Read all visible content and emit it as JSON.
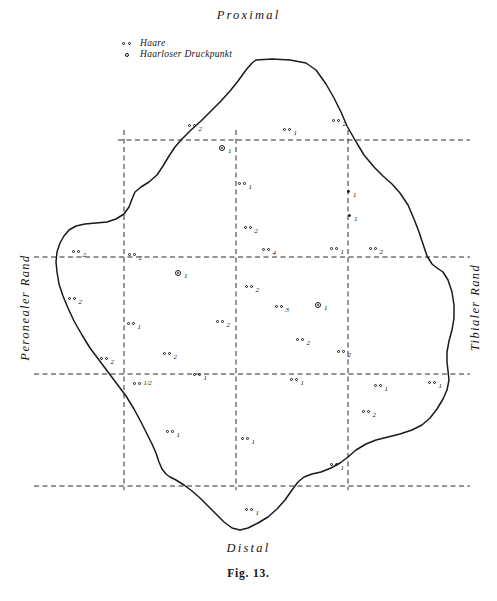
{
  "figure": {
    "caption": "Fig. 13.",
    "orientation_labels": {
      "top": "Proximal",
      "bottom": "Distal",
      "left": "Peronealer Rand",
      "right": "Tibialer Rand"
    },
    "legend": {
      "items": [
        {
          "symbol": "double-dot",
          "label": "Haare"
        },
        {
          "symbol": "circle",
          "label": "Haarloser Druckpunkt"
        }
      ]
    },
    "colors": {
      "ink": "#141414",
      "outline": "#1a1a1a",
      "grid": "#2a2a2a",
      "background": "#ffffff"
    }
  },
  "chart_data": {
    "type": "scatter",
    "title": "Fig. 13.",
    "xlabel": "",
    "ylabel": "",
    "xlim": [
      0,
      497
    ],
    "ylim": [
      0,
      601
    ],
    "grid": true,
    "grid_style": "dashed",
    "grid_x": [
      124,
      236,
      348
    ],
    "grid_y": [
      140,
      257,
      374,
      486
    ],
    "legend_position": "top-left",
    "series": [
      {
        "name": "Haare",
        "marker": "double-circle-pair",
        "points": [
          {
            "x": 188,
            "y": 124,
            "label": "2"
          },
          {
            "x": 283,
            "y": 128,
            "label": "1"
          },
          {
            "x": 332,
            "y": 119,
            "label": "2"
          },
          {
            "x": 238,
            "y": 182,
            "label": "1"
          },
          {
            "x": 244,
            "y": 226,
            "label": "2"
          },
          {
            "x": 262,
            "y": 248,
            "label": "4"
          },
          {
            "x": 330,
            "y": 247,
            "label": "1"
          },
          {
            "x": 369,
            "y": 247,
            "label": "2"
          },
          {
            "x": 72,
            "y": 250,
            "label": "2"
          },
          {
            "x": 128,
            "y": 253,
            "label": "2"
          },
          {
            "x": 245,
            "y": 285,
            "label": "2"
          },
          {
            "x": 275,
            "y": 305,
            "label": "3"
          },
          {
            "x": 68,
            "y": 297,
            "label": "2"
          },
          {
            "x": 127,
            "y": 322,
            "label": "1"
          },
          {
            "x": 216,
            "y": 320,
            "label": "2"
          },
          {
            "x": 296,
            "y": 338,
            "label": "2"
          },
          {
            "x": 337,
            "y": 350,
            "label": "2"
          },
          {
            "x": 100,
            "y": 357,
            "label": "2"
          },
          {
            "x": 163,
            "y": 352,
            "label": "2"
          },
          {
            "x": 193,
            "y": 373,
            "label": "1"
          },
          {
            "x": 133,
            "y": 382,
            "label": "1/2"
          },
          {
            "x": 290,
            "y": 378,
            "label": "1"
          },
          {
            "x": 374,
            "y": 384,
            "label": "1"
          },
          {
            "x": 428,
            "y": 381,
            "label": "1"
          },
          {
            "x": 166,
            "y": 430,
            "label": "1"
          },
          {
            "x": 241,
            "y": 437,
            "label": "1"
          },
          {
            "x": 362,
            "y": 410,
            "label": "2"
          },
          {
            "x": 245,
            "y": 508,
            "label": "1"
          },
          {
            "x": 330,
            "y": 463,
            "label": "1"
          }
        ]
      },
      {
        "name": "Haarloser Druckpunkt",
        "marker": "double-ring",
        "points": [
          {
            "x": 219,
            "y": 146,
            "label": "1"
          },
          {
            "x": 175,
            "y": 271,
            "label": "1"
          },
          {
            "x": 315,
            "y": 303,
            "label": "1"
          }
        ]
      },
      {
        "name": "filled point",
        "marker": "filled-dot",
        "points": [
          {
            "x": 347,
            "y": 190,
            "label": "1"
          },
          {
            "x": 348,
            "y": 214,
            "label": "1"
          }
        ]
      }
    ],
    "outline": {
      "name": "foot-sole-outline",
      "closed": true,
      "points": [
        [
          256,
          60
        ],
        [
          272,
          59
        ],
        [
          290,
          60
        ],
        [
          306,
          63
        ],
        [
          316,
          70
        ],
        [
          326,
          84
        ],
        [
          334,
          98
        ],
        [
          341,
          112
        ],
        [
          347,
          126
        ],
        [
          355,
          140
        ],
        [
          364,
          155
        ],
        [
          374,
          167
        ],
        [
          383,
          176
        ],
        [
          392,
          184
        ],
        [
          400,
          193
        ],
        [
          408,
          205
        ],
        [
          414,
          219
        ],
        [
          419,
          232
        ],
        [
          423,
          244
        ],
        [
          427,
          256
        ],
        [
          432,
          264
        ],
        [
          437,
          268
        ],
        [
          443,
          272
        ],
        [
          448,
          280
        ],
        [
          452,
          292
        ],
        [
          454,
          305
        ],
        [
          454,
          318
        ],
        [
          452,
          330
        ],
        [
          449,
          341
        ],
        [
          447,
          352
        ],
        [
          447,
          362
        ],
        [
          448,
          371
        ],
        [
          449,
          380
        ],
        [
          447,
          390
        ],
        [
          443,
          399
        ],
        [
          437,
          409
        ],
        [
          430,
          418
        ],
        [
          422,
          425
        ],
        [
          412,
          430
        ],
        [
          400,
          434
        ],
        [
          388,
          437
        ],
        [
          376,
          440
        ],
        [
          366,
          444
        ],
        [
          356,
          450
        ],
        [
          348,
          457
        ],
        [
          340,
          463
        ],
        [
          331,
          468
        ],
        [
          321,
          472
        ],
        [
          312,
          474
        ],
        [
          304,
          477
        ],
        [
          298,
          482
        ],
        [
          292,
          490
        ],
        [
          285,
          500
        ],
        [
          277,
          509
        ],
        [
          268,
          517
        ],
        [
          258,
          523
        ],
        [
          248,
          528
        ],
        [
          240,
          530
        ],
        [
          232,
          528
        ],
        [
          224,
          522
        ],
        [
          216,
          514
        ],
        [
          208,
          506
        ],
        [
          200,
          498
        ],
        [
          192,
          491
        ],
        [
          184,
          485
        ],
        [
          176,
          480
        ],
        [
          170,
          477
        ],
        [
          166,
          474
        ],
        [
          162,
          469
        ],
        [
          159,
          462
        ],
        [
          156,
          453
        ],
        [
          152,
          444
        ],
        [
          147,
          434
        ],
        [
          141,
          422
        ],
        [
          134,
          409
        ],
        [
          126,
          396
        ],
        [
          117,
          384
        ],
        [
          108,
          372
        ],
        [
          99,
          360
        ],
        [
          90,
          348
        ],
        [
          82,
          335
        ],
        [
          74,
          321
        ],
        [
          68,
          308
        ],
        [
          63,
          296
        ],
        [
          59,
          284
        ],
        [
          57,
          272
        ],
        [
          56,
          262
        ],
        [
          57,
          252
        ],
        [
          60,
          243
        ],
        [
          64,
          236
        ],
        [
          69,
          230
        ],
        [
          76,
          226
        ],
        [
          85,
          224
        ],
        [
          96,
          223
        ],
        [
          107,
          222
        ],
        [
          116,
          219
        ],
        [
          124,
          214
        ],
        [
          129,
          207
        ],
        [
          132,
          199
        ],
        [
          135,
          192
        ],
        [
          141,
          187
        ],
        [
          149,
          182
        ],
        [
          157,
          175
        ],
        [
          163,
          166
        ],
        [
          169,
          156
        ],
        [
          175,
          147
        ],
        [
          182,
          139
        ],
        [
          191,
          130
        ],
        [
          201,
          121
        ],
        [
          211,
          111
        ],
        [
          221,
          101
        ],
        [
          230,
          91
        ],
        [
          238,
          81
        ],
        [
          246,
          70
        ],
        [
          252,
          63
        ],
        [
          256,
          60
        ]
      ]
    }
  }
}
